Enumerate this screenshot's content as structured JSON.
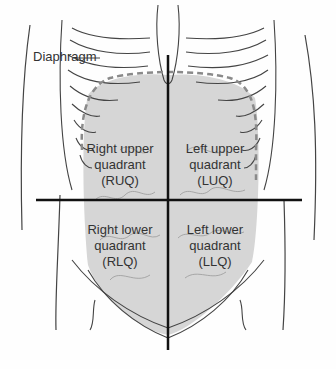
{
  "diagram": {
    "labels": {
      "diaphragm": "Diaphragm"
    },
    "quadrants": [
      {
        "id": "ruq",
        "line1": "Right upper",
        "line2": "quadrant",
        "abbr": "(RUQ)"
      },
      {
        "id": "luq",
        "line1": "Left upper",
        "line2": "quadrant",
        "abbr": "(LUQ)"
      },
      {
        "id": "rlq",
        "line1": "Right lower",
        "line2": "quadrant",
        "abbr": "(RLQ)"
      },
      {
        "id": "llq",
        "line1": "Left lower",
        "line2": "quadrant",
        "abbr": "(LLQ)"
      }
    ],
    "colors": {
      "abdomen_fill": "#d6d6d6",
      "outline": "#444444",
      "axis": "#111111",
      "dashed": "#8a8a8a"
    }
  }
}
